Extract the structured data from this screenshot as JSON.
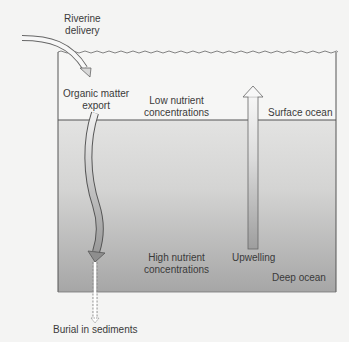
{
  "labels": {
    "riverine_line1": "Riverine",
    "riverine_line2": "delivery",
    "organic_line1": "Organic matter",
    "organic_line2": "export",
    "low_line1": "Low nutrient",
    "low_line2": "concentrations",
    "surface_ocean": "Surface ocean",
    "high_line1": "High nutrient",
    "high_line2": "concentrations",
    "upwelling": "Upwelling",
    "deep_ocean": "Deep ocean",
    "burial": "Burial in sediments"
  },
  "colors": {
    "background": "#f4f4f3",
    "surface_layer": "#f6f6f5",
    "deep_top": "#e2e2e1",
    "deep_bottom": "#a9a9a9",
    "outline": "#555555"
  }
}
